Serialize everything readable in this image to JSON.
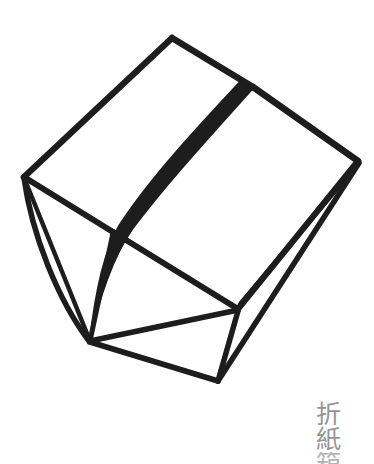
{
  "canvas": {
    "width": 374,
    "height": 458,
    "background_color": "#ffffff"
  },
  "artwork": {
    "title": "folded-paper-box-line-drawing",
    "style": "hand-drawn black ink line art",
    "ink_color": "#1d1d1d",
    "fold_band_color": "#1d1d1d",
    "description": "Line drawing of an open origami paper box seen in three-quarter view with a dark curved crease band running across the top face down to the bottom vertex"
  },
  "caption": {
    "characters": [
      {
        "glyph": "折",
        "partial": false
      },
      {
        "glyph": "紙",
        "partial": false
      },
      {
        "glyph": "箱",
        "partial": true
      }
    ],
    "color": "#949494",
    "reading": "origami",
    "position": "bottom-right"
  },
  "geometry": {
    "vertices": {
      "top_apex": [
        172,
        38
      ],
      "left_corner": [
        25,
        178
      ],
      "right_corner": [
        358,
        162
      ],
      "band_top": [
        252,
        88
      ],
      "bottom_vertex": [
        90,
        341
      ],
      "inner_mid": [
        112,
        232
      ],
      "inner_right": [
        238,
        310
      ],
      "bottom_right": [
        218,
        380
      ],
      "right_flap_low": [
        248,
        298
      ]
    },
    "edge_count": 14,
    "stroke_width_main": 6,
    "stroke_width_thin": 4
  }
}
